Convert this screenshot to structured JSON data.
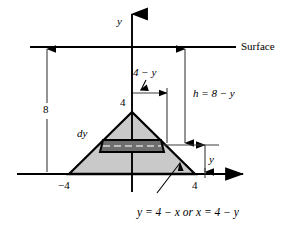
{
  "figure": {
    "type": "math-diagram",
    "axes": {
      "y_axis_label": "y",
      "x_axis_label": ""
    },
    "labels": {
      "surface": "Surface",
      "depth_total": "8",
      "apex_value": "4",
      "left_base_value": "−4",
      "right_base_value": "4",
      "strip_thickness": "dy",
      "half_width": "4 − y",
      "depth_expression": "h = 8 − y",
      "strip_depth": "y",
      "boundary_equation": "y = 4 − x or x = 4 − y"
    },
    "geometry": {
      "apex": {
        "x": 0,
        "y": 4
      },
      "left_base": {
        "x": -4,
        "y": 0
      },
      "right_base": {
        "x": 4,
        "y": 0
      },
      "surface_level_y": 8,
      "strip_y": 1.55,
      "strip_half_width": "4 - y"
    },
    "colors": {
      "triangle_fill": "#c9c9c9",
      "strip_fill": "#6e6e6e",
      "stroke": "#000000",
      "thin_line": "#4a4a4a",
      "background": "#ffffff"
    }
  }
}
